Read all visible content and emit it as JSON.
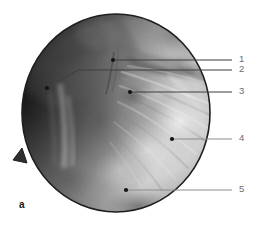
{
  "figure": {
    "panel_letter": "a",
    "type": "endoscopic-photograph",
    "shape": "circular-field-of-view",
    "caption_labels": [
      "1",
      "2",
      "3",
      "4",
      "5"
    ]
  },
  "colors": {
    "background": "#ffffff",
    "scope_rim": "#1a1a1a",
    "leader_line": "#8c8c8c",
    "leader_line_dark": "#3a3a3a",
    "label_text": "#6d6d6d",
    "panel_letter": "#1a1a1a",
    "tissue_light": "#d8d8d8",
    "tissue_mid": "#a8a8a8",
    "tissue_dark": "#4a4a4a",
    "vignette": "#2a2a2a"
  },
  "scope": {
    "center_x": 116,
    "center_y": 113,
    "radius_x": 94,
    "radius_y": 99,
    "notch_label": "scope-edge-notch"
  },
  "annotations": [
    {
      "id": "1",
      "label": "1",
      "dot_x": 113,
      "dot_y": 60,
      "line_end_x": 232,
      "line_end_y": 60,
      "label_x": 240,
      "label_y": 54,
      "style": "dark"
    },
    {
      "id": "2",
      "label": "2",
      "dot_x": 47,
      "dot_y": 88,
      "elbow_x": 78,
      "elbow_y": 70,
      "line_end_x": 232,
      "line_end_y": 70,
      "label_x": 240,
      "label_y": 64,
      "style": "dark"
    },
    {
      "id": "3",
      "label": "3",
      "dot_x": 130,
      "dot_y": 92,
      "line_end_x": 232,
      "line_end_y": 92,
      "label_x": 240,
      "label_y": 86,
      "style": "dark"
    },
    {
      "id": "4",
      "label": "4",
      "dot_x": 172,
      "dot_y": 139,
      "line_end_x": 232,
      "line_end_y": 139,
      "label_x": 240,
      "label_y": 133,
      "style": "light"
    },
    {
      "id": "5",
      "label": "5",
      "dot_x": 126,
      "dot_y": 190,
      "line_end_x": 232,
      "line_end_y": 190,
      "label_x": 240,
      "label_y": 184,
      "style": "light"
    }
  ]
}
